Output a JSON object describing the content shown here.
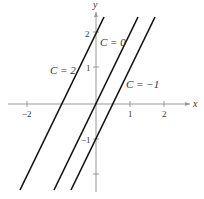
{
  "axes": {
    "x_label": "x",
    "y_label": "y",
    "x_ticks": [
      {
        "value": -2,
        "label": "−2"
      },
      {
        "value": 1,
        "label": "1"
      },
      {
        "value": 2,
        "label": "2"
      }
    ],
    "y_ticks": [
      {
        "value": 2,
        "label": "2"
      },
      {
        "value": 1,
        "label": "1"
      },
      {
        "value": -1,
        "label": "−1"
      },
      {
        "value": -2,
        "label": ""
      }
    ]
  },
  "curves": [
    {
      "label": "C = 2",
      "equation": "y = 2x + 2"
    },
    {
      "label": "C = 0",
      "equation": "y = 2x"
    },
    {
      "label": "C = −1",
      "equation": "y = 2x − 1"
    }
  ],
  "colors": {
    "axis": "#999999",
    "curve": "#111111",
    "text": "#333333"
  }
}
